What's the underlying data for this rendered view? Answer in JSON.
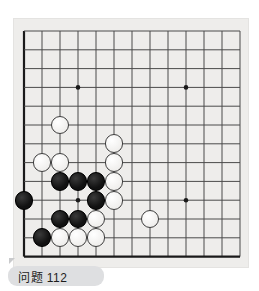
{
  "caption": {
    "label": "问题 112",
    "corner_icon": "folded-corner-icon"
  },
  "board": {
    "title": "go-board",
    "size_lines": 13,
    "line_color": "#4a4a4a",
    "edge_color": "#1a1a1a",
    "background_color": "#eeedeb",
    "stone_radius": 9.4,
    "grid": {
      "origin_x": 10,
      "origin_y": 12,
      "spacing_x": 18.0,
      "spacing_y": 18.8,
      "cols": 13,
      "rows": 13
    },
    "star_points": [
      {
        "col": 3,
        "row": 3
      },
      {
        "col": 9,
        "row": 3
      },
      {
        "col": 3,
        "row": 9
      },
      {
        "col": 9,
        "row": 9
      }
    ],
    "stones": [
      {
        "color": "white",
        "col": 2,
        "row": 5
      },
      {
        "color": "white",
        "col": 5,
        "row": 6
      },
      {
        "color": "white",
        "col": 1,
        "row": 7
      },
      {
        "color": "white",
        "col": 2,
        "row": 7
      },
      {
        "color": "white",
        "col": 5,
        "row": 7
      },
      {
        "color": "black",
        "col": 2,
        "row": 8
      },
      {
        "color": "black",
        "col": 3,
        "row": 8
      },
      {
        "color": "black",
        "col": 4,
        "row": 8
      },
      {
        "color": "white",
        "col": 5,
        "row": 8
      },
      {
        "color": "black",
        "col": 0,
        "row": 9
      },
      {
        "color": "black",
        "col": 4,
        "row": 9
      },
      {
        "color": "white",
        "col": 5,
        "row": 9
      },
      {
        "color": "black",
        "col": 2,
        "row": 10
      },
      {
        "color": "black",
        "col": 3,
        "row": 10
      },
      {
        "color": "white",
        "col": 4,
        "row": 10
      },
      {
        "color": "white",
        "col": 7,
        "row": 10
      },
      {
        "color": "black",
        "col": 1,
        "row": 11
      },
      {
        "color": "white",
        "col": 2,
        "row": 11
      },
      {
        "color": "white",
        "col": 3,
        "row": 11
      },
      {
        "color": "white",
        "col": 4,
        "row": 11
      }
    ]
  }
}
